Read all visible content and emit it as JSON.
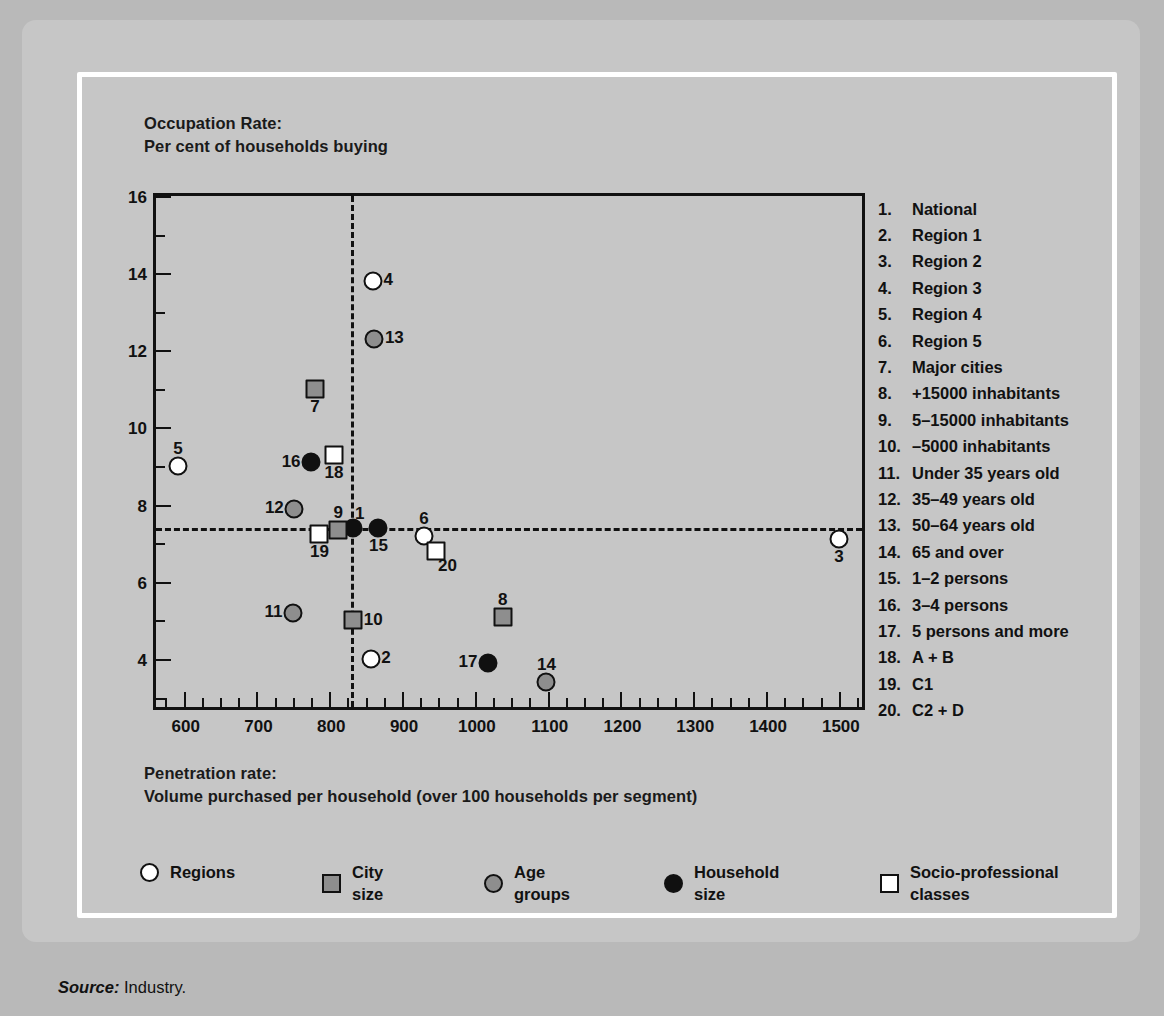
{
  "chart_data": {
    "type": "scatter",
    "title": "",
    "ylabel": "Occupation Rate:\nPer cent of households buying",
    "xlabel": "Penetration rate:\nVolume purchased per household (over 100 households per segment)",
    "xlim": [
      562,
      1540
    ],
    "ylim": [
      2.6,
      16
    ],
    "xticks": [
      600,
      700,
      800,
      900,
      1000,
      1100,
      1200,
      1300,
      1400,
      1500
    ],
    "xtick_labels": [
      "600",
      "700",
      "800",
      "900",
      "1000",
      "1100",
      "1200",
      "1300",
      "1400",
      "1500"
    ],
    "x_minor_step": 25,
    "yticks": [
      4,
      6,
      8,
      10,
      12,
      14,
      16
    ],
    "ytick_labels": [
      "4",
      "6",
      "8",
      "10",
      "12",
      "14",
      "16"
    ],
    "y_minor_ticks": [
      3,
      5,
      7,
      9,
      11,
      13,
      15
    ],
    "grid": false,
    "reference_lines": {
      "vertical_x": 830,
      "horizontal_y": 7.4
    },
    "legend_position": "bottom",
    "points": [
      {
        "id": 1,
        "label": "1",
        "name": "National",
        "x": 832,
        "y": 7.4,
        "marker": "circle",
        "fill": "black",
        "group": "household-size",
        "label_pos": "lab-tr"
      },
      {
        "id": 2,
        "label": "2",
        "name": "Region 1",
        "x": 857,
        "y": 4.0,
        "marker": "circle",
        "fill": "white",
        "group": "regions",
        "label_pos": "lab-r"
      },
      {
        "id": 3,
        "label": "3",
        "name": "Region 2",
        "x": 1500,
        "y": 7.1,
        "marker": "circle",
        "fill": "white",
        "group": "regions",
        "label_pos": "lab-b"
      },
      {
        "id": 4,
        "label": "4",
        "name": "Region 3",
        "x": 860,
        "y": 13.8,
        "marker": "circle",
        "fill": "white",
        "group": "regions",
        "label_pos": "lab-r"
      },
      {
        "id": 5,
        "label": "5",
        "name": "Region 4",
        "x": 592,
        "y": 9.0,
        "marker": "circle",
        "fill": "white",
        "group": "regions",
        "label_pos": "lab-t"
      },
      {
        "id": 6,
        "label": "6",
        "name": "Region 5",
        "x": 930,
        "y": 7.2,
        "marker": "circle",
        "fill": "white",
        "group": "regions",
        "label_pos": "lab-t"
      },
      {
        "id": 7,
        "label": "7",
        "name": "Major cities",
        "x": 780,
        "y": 11.0,
        "marker": "square",
        "fill": "gray",
        "group": "city-size",
        "label_pos": "lab-b"
      },
      {
        "id": 8,
        "label": "8",
        "name": "+15000 inhabitants",
        "x": 1038,
        "y": 5.1,
        "marker": "square",
        "fill": "gray",
        "group": "city-size",
        "label_pos": "lab-t"
      },
      {
        "id": 9,
        "label": "9",
        "name": "5-15000 inhabitants",
        "x": 812,
        "y": 7.35,
        "marker": "square",
        "fill": "gray",
        "group": "city-size",
        "label_pos": "lab-t"
      },
      {
        "id": 10,
        "label": "10",
        "name": "-5000 inhabitants",
        "x": 833,
        "y": 5.0,
        "marker": "square",
        "fill": "gray",
        "group": "city-size",
        "label_pos": "lab-r"
      },
      {
        "id": 11,
        "label": "11",
        "name": "Under 35 years old",
        "x": 750,
        "y": 5.2,
        "marker": "circle",
        "fill": "gray",
        "group": "age-groups",
        "label_pos": "lab-l"
      },
      {
        "id": 12,
        "label": "12",
        "name": "35-49 years old",
        "x": 752,
        "y": 7.9,
        "marker": "circle",
        "fill": "gray",
        "group": "age-groups",
        "label_pos": "lab-l"
      },
      {
        "id": 13,
        "label": "13",
        "name": "50-64 years old",
        "x": 862,
        "y": 12.3,
        "marker": "circle",
        "fill": "gray",
        "group": "age-groups",
        "label_pos": "lab-r"
      },
      {
        "id": 14,
        "label": "14",
        "name": "65 and over",
        "x": 1098,
        "y": 3.4,
        "marker": "circle",
        "fill": "gray",
        "group": "age-groups",
        "label_pos": "lab-t"
      },
      {
        "id": 15,
        "label": "15",
        "name": "1-2 persons",
        "x": 867,
        "y": 7.4,
        "marker": "circle",
        "fill": "black",
        "group": "household-size",
        "label_pos": "lab-b"
      },
      {
        "id": 16,
        "label": "16",
        "name": "3-4 persons",
        "x": 775,
        "y": 9.1,
        "marker": "circle",
        "fill": "black",
        "group": "household-size",
        "label_pos": "lab-l"
      },
      {
        "id": 17,
        "label": "17",
        "name": "5 persons and more",
        "x": 1018,
        "y": 3.9,
        "marker": "circle",
        "fill": "black",
        "group": "household-size",
        "label_pos": "lab-l"
      },
      {
        "id": 18,
        "label": "18",
        "name": "A + B",
        "x": 806,
        "y": 9.3,
        "marker": "square",
        "fill": "white",
        "group": "socio-classes",
        "label_pos": "lab-b"
      },
      {
        "id": 19,
        "label": "19",
        "name": "C1",
        "x": 786,
        "y": 7.25,
        "marker": "square",
        "fill": "white",
        "group": "socio-classes",
        "label_pos": "lab-b"
      },
      {
        "id": 20,
        "label": "20",
        "name": "C2 + D",
        "x": 946,
        "y": 6.8,
        "marker": "square",
        "fill": "white",
        "group": "socio-classes",
        "label_pos": "lab-br"
      }
    ],
    "series": [
      {
        "name": "Regions",
        "marker": "circle",
        "fill": "white",
        "point_ids": [
          2,
          3,
          4,
          5,
          6
        ]
      },
      {
        "name": "City\nsize",
        "marker": "square",
        "fill": "gray",
        "point_ids": [
          7,
          8,
          9,
          10
        ]
      },
      {
        "name": "Age\ngroups",
        "marker": "circle",
        "fill": "gray",
        "point_ids": [
          11,
          12,
          13,
          14
        ]
      },
      {
        "name": "Household\nsize",
        "marker": "circle",
        "fill": "black",
        "point_ids": [
          1,
          15,
          16,
          17
        ]
      },
      {
        "name": "Socio-professional\nclasses",
        "marker": "square",
        "fill": "white",
        "point_ids": [
          18,
          19,
          20
        ]
      }
    ]
  },
  "key_list": [
    {
      "num": "1.",
      "text": "National"
    },
    {
      "num": "2.",
      "text": "Region 1"
    },
    {
      "num": "3.",
      "text": "Region 2"
    },
    {
      "num": "4.",
      "text": "Region 3"
    },
    {
      "num": "5.",
      "text": "Region 4"
    },
    {
      "num": "6.",
      "text": "Region 5"
    },
    {
      "num": "7.",
      "text": "Major cities"
    },
    {
      "num": "8.",
      "text": "+15000 inhabitants"
    },
    {
      "num": "9.",
      "text": "5–15000 inhabitants"
    },
    {
      "num": "10.",
      "text": "–5000 inhabitants"
    },
    {
      "num": "11.",
      "text": "Under 35 years old"
    },
    {
      "num": "12.",
      "text": "35–49 years old"
    },
    {
      "num": "13.",
      "text": "50–64 years old"
    },
    {
      "num": "14.",
      "text": "65 and over"
    },
    {
      "num": "15.",
      "text": "1–2 persons"
    },
    {
      "num": "16.",
      "text": "3–4 persons"
    },
    {
      "num": "17.",
      "text": "5 persons and more"
    },
    {
      "num": "18.",
      "text": "A + B"
    },
    {
      "num": "19.",
      "text": "C1"
    },
    {
      "num": "20.",
      "text": "C2 + D"
    }
  ],
  "legend_items": [
    {
      "name": "regions",
      "label": "Regions",
      "marker": "circle",
      "fill": "white",
      "left": 0
    },
    {
      "name": "city-size",
      "label": "City\nsize",
      "marker": "square",
      "fill": "gray",
      "left": 182
    },
    {
      "name": "age-groups",
      "label": "Age\ngroups",
      "marker": "circle",
      "fill": "gray",
      "left": 344
    },
    {
      "name": "household-size",
      "label": "Household\nsize",
      "marker": "circle",
      "fill": "black",
      "left": 524
    },
    {
      "name": "socio-classes",
      "label": "Socio-professional\nclasses",
      "marker": "square",
      "fill": "white",
      "left": 740
    }
  ],
  "source": {
    "prefix": "Source:",
    "text": "Industry."
  },
  "colors": {
    "panel_bg": "#c6c6c6",
    "page_bg": "#b9b9b9",
    "frame": "#ffffff",
    "axis": "#111111",
    "marker_gray": "#8e8e8e",
    "marker_black": "#101010",
    "marker_white": "#ffffff"
  }
}
